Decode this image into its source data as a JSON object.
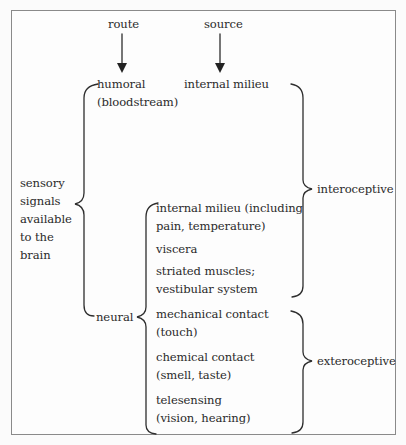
{
  "diagram": {
    "headers": {
      "route": "route",
      "source": "source"
    },
    "root_label": [
      "sensory",
      "signals",
      "available",
      "to the",
      "brain"
    ],
    "routes": {
      "humoral": {
        "label": "humoral",
        "sub": "(bloodstream)",
        "source": "internal milieu"
      },
      "neural": {
        "label": "neural",
        "sources": [
          {
            "line1": "internal milieu (including",
            "line2": "pain, temperature)"
          },
          {
            "line1": "viscera",
            "line2": ""
          },
          {
            "line1": "striated muscles;",
            "line2": "vestibular system"
          },
          {
            "line1": "mechanical contact",
            "line2": "(touch)"
          },
          {
            "line1": "chemical contact",
            "line2": "(smell, taste)"
          },
          {
            "line1": "telesensing",
            "line2": "(vision, hearing)"
          }
        ]
      }
    },
    "categories": {
      "interoceptive": "interoceptive",
      "exteroceptive": "exteroceptive"
    }
  }
}
